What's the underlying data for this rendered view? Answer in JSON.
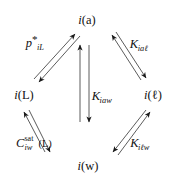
{
  "diagram": {
    "type": "thermodynamic-cycle",
    "shape": "diamond",
    "background_color": "#ffffff",
    "ink_color": "#111111",
    "nodes": [
      {
        "id": "air",
        "position": "top",
        "symbol": "i",
        "phase": "(a)",
        "text": "i (a)",
        "x": 87,
        "y": 20
      },
      {
        "id": "lipid",
        "position": "left",
        "symbol": "i",
        "phase": "(L)",
        "text": "i (L)",
        "x": 24,
        "y": 95
      },
      {
        "id": "octanol",
        "position": "right",
        "symbol": "i",
        "phase": "(ℓ)",
        "text": "i (ℓ)",
        "x": 153,
        "y": 95
      },
      {
        "id": "water",
        "position": "bottom",
        "symbol": "i",
        "phase": "(w)",
        "text": "i (w)",
        "x": 88,
        "y": 166
      }
    ],
    "edges": [
      {
        "id": "lipid-air",
        "from": "lipid",
        "to": "air",
        "bidirectional": true,
        "label": {
          "base": "p",
          "sub": "iL",
          "sup": "*",
          "text": "p*iL"
        },
        "label_x": 35,
        "label_y": 43
      },
      {
        "id": "air-octanol",
        "from": "air",
        "to": "octanol",
        "bidirectional": true,
        "label": {
          "base": "K",
          "sub": "iaℓ",
          "text": "Kiaℓ"
        },
        "label_x": 139,
        "label_y": 44
      },
      {
        "id": "air-water",
        "from": "air",
        "to": "water",
        "bidirectional": true,
        "label": {
          "base": "K",
          "sub": "iaw",
          "text": "Kiaw"
        },
        "label_x": 102,
        "label_y": 96
      },
      {
        "id": "lipid-water",
        "from": "lipid",
        "to": "water",
        "bidirectional": true,
        "label": {
          "base": "C",
          "sub": "iw",
          "sup": "sat",
          "tail": "(L)",
          "text": "Csat iw (L)"
        },
        "label_x": 34,
        "label_y": 143
      },
      {
        "id": "water-octanol",
        "from": "water",
        "to": "octanol",
        "bidirectional": true,
        "label": {
          "base": "K",
          "sub": "iℓw",
          "text": "Kiℓw"
        },
        "label_x": 140,
        "label_y": 143
      }
    ]
  }
}
